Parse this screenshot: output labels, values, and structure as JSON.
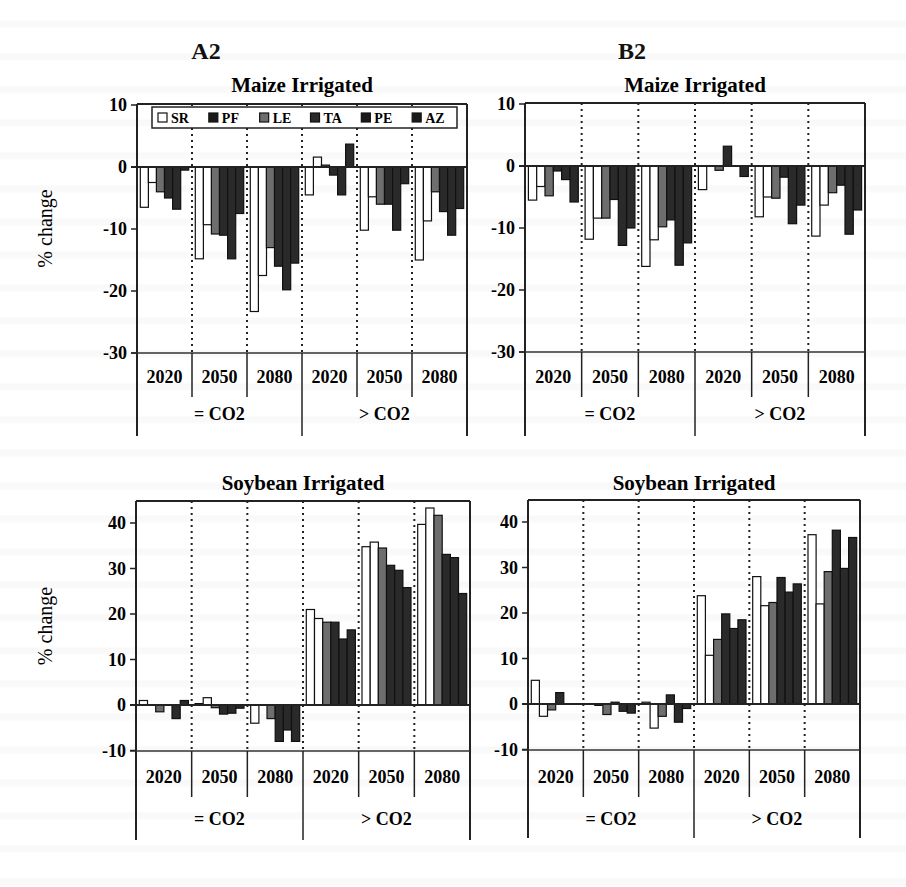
{
  "chart_data": [
    {
      "type": "bar",
      "scenario": "A2",
      "title": "Maize Irrigated",
      "ylabel": "% change",
      "ylim": [
        -30,
        10
      ],
      "yticks": [
        "10",
        "0",
        "-10",
        "-20",
        "-30"
      ],
      "ytick_values": [
        10,
        0,
        -10,
        -20,
        -30
      ],
      "categories": [
        "2020",
        "2050",
        "2080",
        "2020",
        "2050",
        "2080"
      ],
      "groups": [
        "= CO2",
        "> CO2"
      ],
      "legend": [
        "SR",
        "PF",
        "LE",
        "TA",
        "PE",
        "AZ"
      ],
      "legend_position": "top",
      "series": [
        {
          "name": "SR",
          "values": [
            -6.5,
            -14.8,
            -23.3,
            -4.5,
            -10.2,
            -15.0
          ]
        },
        {
          "name": "PF",
          "values": [
            -2.5,
            -9.3,
            -17.5,
            1.6,
            -4.8,
            -8.7
          ]
        },
        {
          "name": "LE",
          "values": [
            -4.0,
            -10.8,
            -13.0,
            0.3,
            -6.0,
            -4.0
          ]
        },
        {
          "name": "TA",
          "values": [
            -5.0,
            -11.0,
            -16.0,
            -1.3,
            -6.0,
            -7.2
          ]
        },
        {
          "name": "PE",
          "values": [
            -6.8,
            -14.8,
            -19.8,
            -4.5,
            -10.2,
            -11.0
          ]
        },
        {
          "name": "AZ",
          "values": [
            -0.5,
            -7.5,
            -15.5,
            3.7,
            -2.7,
            -6.7
          ]
        }
      ]
    },
    {
      "type": "bar",
      "scenario": "B2",
      "title": "Maize Irrigated",
      "ylabel": "",
      "ylim": [
        -30,
        10
      ],
      "yticks": [
        "10",
        "0",
        "-10",
        "-20",
        "-30"
      ],
      "ytick_values": [
        10,
        0,
        -10,
        -20,
        -30
      ],
      "categories": [
        "2020",
        "2050",
        "2080",
        "2020",
        "2050",
        "2080"
      ],
      "groups": [
        "= CO2",
        "> CO2"
      ],
      "legend": [],
      "series": [
        {
          "name": "SR",
          "values": [
            -5.5,
            -11.8,
            -16.2,
            -3.8,
            -8.2,
            -11.3
          ]
        },
        {
          "name": "PF",
          "values": [
            -3.3,
            -8.4,
            -11.9,
            0.0,
            -5.0,
            -6.3
          ]
        },
        {
          "name": "LE",
          "values": [
            -4.8,
            -8.4,
            -9.8,
            -0.7,
            -5.2,
            -4.3
          ]
        },
        {
          "name": "TA",
          "values": [
            -0.8,
            -5.4,
            -8.7,
            3.2,
            -1.8,
            -3.1
          ]
        },
        {
          "name": "PE",
          "values": [
            -2.2,
            -12.8,
            -16.0,
            0.0,
            -9.3,
            -11.0
          ]
        },
        {
          "name": "AZ",
          "values": [
            -5.8,
            -10.0,
            -12.4,
            -1.7,
            -6.3,
            -7.1
          ]
        }
      ]
    },
    {
      "type": "bar",
      "scenario": "A2",
      "title": "Soybean Irrigated",
      "ylabel": "% change",
      "ylim": [
        -10,
        45
      ],
      "yticks": [
        "40",
        "30",
        "20",
        "10",
        "0",
        "-10"
      ],
      "ytick_values": [
        40,
        30,
        20,
        10,
        0,
        -10
      ],
      "categories": [
        "2020",
        "2050",
        "2080",
        "2020",
        "2050",
        "2080"
      ],
      "groups": [
        "= CO2",
        "> CO2"
      ],
      "legend": [],
      "series": [
        {
          "name": "SR",
          "values": [
            1.0,
            0.3,
            -4.0,
            21.0,
            34.8,
            39.7
          ]
        },
        {
          "name": "PF",
          "values": [
            0.0,
            1.6,
            0.0,
            19.0,
            35.8,
            43.3
          ]
        },
        {
          "name": "LE",
          "values": [
            -1.5,
            -0.6,
            -3.0,
            18.2,
            34.5,
            41.7
          ]
        },
        {
          "name": "TA",
          "values": [
            0.0,
            -2.0,
            -8.0,
            18.2,
            30.7,
            33.1
          ]
        },
        {
          "name": "PE",
          "values": [
            -3.0,
            -1.8,
            -5.5,
            14.5,
            29.6,
            32.4
          ]
        },
        {
          "name": "AZ",
          "values": [
            1.0,
            -0.7,
            -8.0,
            16.5,
            25.8,
            24.5
          ]
        }
      ]
    },
    {
      "type": "bar",
      "scenario": "B2",
      "title": "Soybean Irrigated",
      "ylabel": "",
      "ylim": [
        -10,
        45
      ],
      "yticks": [
        "40",
        "30",
        "20",
        "10",
        "0",
        "-10"
      ],
      "ytick_values": [
        40,
        30,
        20,
        10,
        0,
        -10
      ],
      "categories": [
        "2020",
        "2050",
        "2080",
        "2020",
        "2050",
        "2080"
      ],
      "groups": [
        "= CO2",
        "> CO2"
      ],
      "legend": [],
      "series": [
        {
          "name": "SR",
          "values": [
            5.2,
            0.0,
            0.4,
            23.8,
            28.0,
            37.2
          ]
        },
        {
          "name": "PF",
          "values": [
            -2.7,
            -0.3,
            -5.3,
            10.7,
            21.6,
            22.0
          ]
        },
        {
          "name": "LE",
          "values": [
            -1.3,
            -2.3,
            -2.7,
            14.2,
            22.3,
            29.1
          ]
        },
        {
          "name": "TA",
          "values": [
            2.5,
            0.4,
            2.0,
            19.8,
            27.8,
            38.2
          ]
        },
        {
          "name": "PE",
          "values": [
            0.0,
            -1.6,
            -4.0,
            16.6,
            24.6,
            29.8
          ]
        },
        {
          "name": "AZ",
          "values": [
            0.0,
            -2.0,
            -1.0,
            18.5,
            26.4,
            36.6
          ]
        }
      ]
    }
  ],
  "series_colors": {
    "SR": "#ffffff",
    "PF": "#ffffff",
    "LE": "#6e6e6e",
    "TA": "#2a2a2a",
    "PE": "#2a2a2a",
    "AZ": "#2a2a2a"
  },
  "legend_swatches": {
    "SR": "#ffffff",
    "PF": "#1a1a1a",
    "LE": "#6e6e6e",
    "TA": "#2a2a2a",
    "PE": "#1a1a1a",
    "AZ": "#1a1a1a"
  },
  "scenarios": [
    "A2",
    "B2"
  ]
}
